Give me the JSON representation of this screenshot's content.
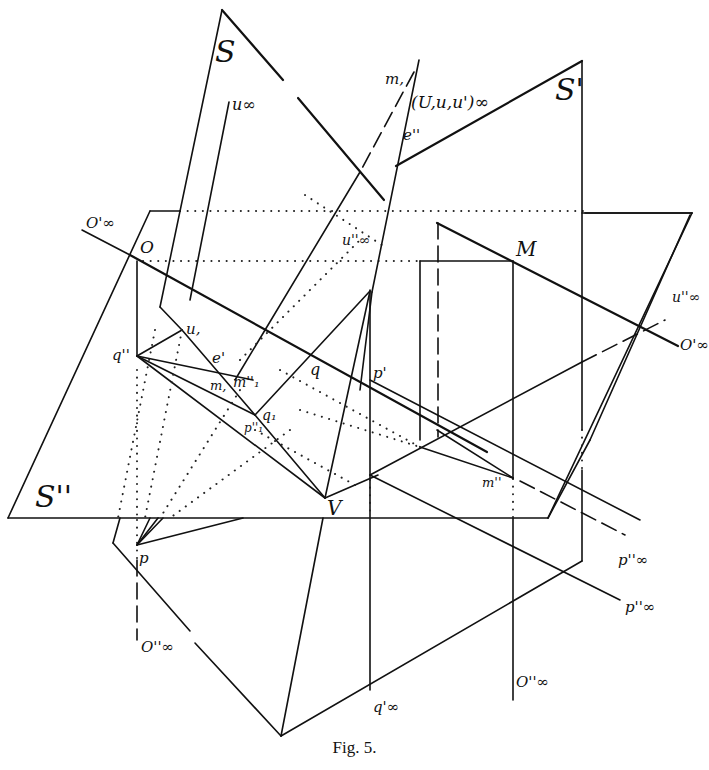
{
  "figure": {
    "caption": "Fig. 5.",
    "labels": {
      "S": "S",
      "S_prime": "S'",
      "S_dprime": "S''",
      "u_inf": "u∞",
      "U_u_u_inf": "(U,u,u')∞",
      "m1_top": "m,",
      "e_dprime": "e''",
      "O_inf_prime_left": "O'∞",
      "O": "O",
      "u_dprime_inf": "u''∞",
      "M": "M",
      "u_dprime_inf_right": "u''∞",
      "O_inf_prime_right": "O'∞",
      "q_dprime": "q''",
      "u1": "u,",
      "e_prime": "e'",
      "m1": "m,",
      "m1_dprime": "m''₁",
      "q": "q",
      "p_prime": "p'",
      "q1": "q₁",
      "p1_dprime": "p''₁",
      "V": "V",
      "m_dprime": "m''",
      "p": "p",
      "p_dprime_inf_1": "p''∞",
      "p_dprime_inf_2": "p''∞",
      "O_dprime_inf_left": "O''∞",
      "q_prime_inf": "q'∞",
      "O_dprime_inf_right": "O''∞"
    }
  }
}
